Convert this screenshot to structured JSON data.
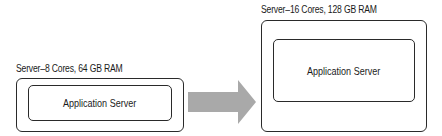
{
  "diagram": {
    "left_server": {
      "label": "Server–8 Cores, 64 GB RAM",
      "inner_label": "Application Server"
    },
    "arrow": {
      "color": "#a6a6a6",
      "direction": "right"
    },
    "right_server": {
      "label": "Server–16 Cores, 128 GB RAM",
      "inner_label": "Application Server"
    }
  }
}
